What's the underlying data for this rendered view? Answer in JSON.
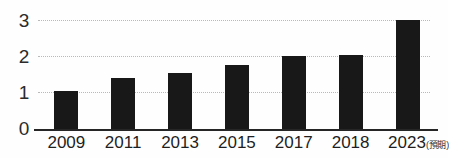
{
  "chart_data": {
    "type": "bar",
    "title": "",
    "subtitle": "",
    "xlabel": "",
    "ylabel": "",
    "categories": [
      "2009",
      "2011",
      "2013",
      "2015",
      "2017",
      "2018",
      "2023"
    ],
    "category_notes": [
      "",
      "",
      "",
      "",
      "",
      "",
      "(預期)"
    ],
    "values": [
      1.05,
      1.4,
      1.55,
      1.75,
      2.0,
      2.05,
      3.0
    ],
    "series": [
      {
        "name": "",
        "values": [
          1.05,
          1.4,
          1.55,
          1.75,
          2.0,
          2.05,
          3.0
        ]
      }
    ],
    "ylim": [
      0,
      3
    ],
    "yticks": [
      "0",
      "1",
      "2",
      "3"
    ],
    "ytick_values": [
      0,
      1,
      2,
      3
    ],
    "gridlines": [
      1,
      2,
      3
    ],
    "grid": true,
    "legend": "none",
    "bar_color": "#181818",
    "gridline_color": "#b9b9b9",
    "axis_color": "#262626",
    "background_color": "#fefefe"
  },
  "axis": {
    "y_label_0": "0",
    "y_label_1": "1",
    "y_label_2": "2",
    "y_label_3": "3"
  },
  "x_axis": {
    "labels": [
      {
        "text": "2009",
        "note": ""
      },
      {
        "text": "2011",
        "note": ""
      },
      {
        "text": "2013",
        "note": ""
      },
      {
        "text": "2015",
        "note": ""
      },
      {
        "text": "2017",
        "note": ""
      },
      {
        "text": "2018",
        "note": ""
      },
      {
        "text": "2023",
        "note": "(預期)"
      }
    ]
  }
}
